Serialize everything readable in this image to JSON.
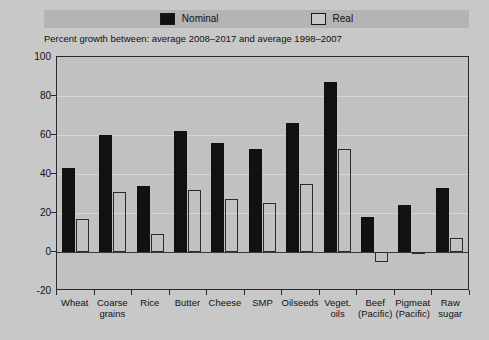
{
  "legend": {
    "items": [
      {
        "label": "Nominal",
        "swatch": "filled-black-swatch",
        "color": "#111111"
      },
      {
        "label": "Real",
        "swatch": "outlined-white-swatch",
        "color": "#c8c8c8"
      }
    ]
  },
  "subtitle": "Percent growth between: average 2008–2017 and average 1998–2007",
  "chart_data": {
    "type": "bar",
    "title": "",
    "subtitle": "Percent growth between: average 2008–2017 and average 1998–2007",
    "xlabel": "",
    "ylabel": "",
    "ylim": [
      -20,
      100
    ],
    "yticks": [
      -20,
      0,
      20,
      40,
      60,
      80,
      100
    ],
    "ytick_labels": [
      "-20",
      "0",
      "20",
      "40",
      "60",
      "80",
      "100"
    ],
    "grid": true,
    "legend_position": "top",
    "categories": [
      "Wheat",
      "Coarse grains",
      "Rice",
      "Butter",
      "Cheese",
      "SMP",
      "Oilseeds",
      "Veget. oils",
      "Beef (Pacific)",
      "Pigmeat (Pacific)",
      "Raw sugar"
    ],
    "category_lines": [
      [
        "Wheat",
        ""
      ],
      [
        "Coarse",
        "grains"
      ],
      [
        "Rice",
        ""
      ],
      [
        "Butter",
        ""
      ],
      [
        "Cheese",
        ""
      ],
      [
        "SMP",
        ""
      ],
      [
        "Oilseeds",
        ""
      ],
      [
        "Veget.",
        "oils"
      ],
      [
        "Beef",
        "(Pacific)"
      ],
      [
        "Pigmeat",
        "(Pacific)"
      ],
      [
        "Raw",
        "sugar"
      ]
    ],
    "series": [
      {
        "name": "Nominal",
        "color": "#111111",
        "values": [
          43,
          60,
          34,
          62,
          56,
          53,
          66,
          87,
          18,
          24,
          33
        ]
      },
      {
        "name": "Real",
        "color": "#c8c8c8",
        "values": [
          17,
          31,
          9,
          32,
          27,
          25,
          35,
          53,
          -5,
          0,
          7
        ]
      }
    ]
  }
}
